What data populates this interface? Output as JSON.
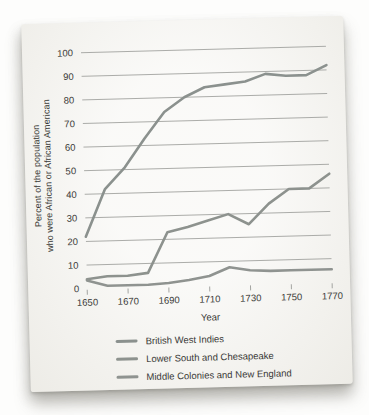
{
  "window": {
    "background": "#fdfdfc"
  },
  "card": {
    "background": "#f4f3ef"
  },
  "chart_data": {
    "type": "line",
    "title": "",
    "xlabel": "Year",
    "ylabel_line1": "Percent of the population",
    "ylabel_line2": "who were African or African American",
    "x": [
      1650,
      1660,
      1670,
      1680,
      1690,
      1700,
      1710,
      1720,
      1730,
      1740,
      1750,
      1760,
      1770
    ],
    "xticks_labeled": [
      1650,
      1670,
      1690,
      1710,
      1730,
      1750,
      1770
    ],
    "ylim": [
      0,
      100
    ],
    "ytick_step": 10,
    "grid": true,
    "legend_position": "bottom",
    "grid_color": "#a3a4a1",
    "axis_text_color": "#3a3a37",
    "series": [
      {
        "name": "British West Indies",
        "color": "#8b918e",
        "values": [
          22,
          42,
          51,
          63,
          74,
          80,
          84,
          85,
          86,
          89,
          88,
          88,
          92
        ]
      },
      {
        "name": "Lower South and Chesapeake",
        "color": "#8d928e",
        "values": [
          4,
          5,
          5,
          6,
          23,
          25,
          27.5,
          30,
          25.5,
          34,
          40,
          40,
          46
        ]
      },
      {
        "name": "Middle Colonies and New England",
        "color": "#8f9390",
        "values": [
          3.5,
          1,
          1,
          1,
          1.5,
          2.5,
          4,
          7.5,
          6,
          5.5,
          5.5,
          5.5,
          5.5
        ]
      }
    ]
  }
}
